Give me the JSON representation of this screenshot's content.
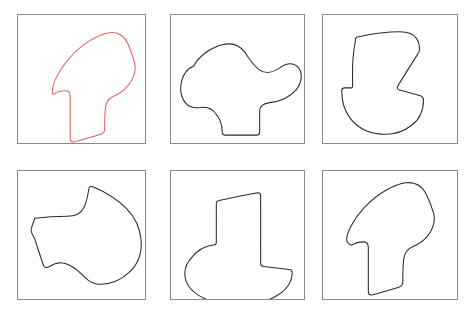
{
  "figure": {
    "kind": "mental-rotation-shape-grid",
    "background_color": "#ffffff",
    "rows": 2,
    "columns": 3,
    "panel_count": 6
  },
  "style": {
    "frame_color": "#8a8a8a",
    "frame_width": 1,
    "default_stroke_color": "#2b2b2b",
    "highlight_stroke_color": "#e06464",
    "stroke_width": 1.05
  },
  "panels": [
    {
      "id": "panel-1",
      "position": "row1-col1",
      "shape_name": "hooked-arch-blob",
      "stroke_color": "#e06464",
      "highlighted": true,
      "x": 17,
      "y": 14,
      "width": 129,
      "height": 130,
      "viewbox": "0 0 129 130",
      "path": "M 35 79 C 34 72 40 58 52 44 C 64 30 80 20 93 18 C 101 17 108 21 111 28 C 114 34 116 41 118 47 C 120 53 119 60 115 67 C 111 74 105 79 98 82 C 93 84 90 88 89 93 C 88 100 88 109 88 116 C 88 119 87 120 84 121 C 74 124 64 127 56 129 C 54 129 53 128 53 126 C 53 112 53 95 53 82 C 53 79 51 77 48 77 C 44 77 40 78 37 80 C 36 81 35 80 35 79 Z"
    },
    {
      "id": "panel-2",
      "position": "row1-col2",
      "shape_name": "smooth-blob-with-tab",
      "stroke_color": "#2b2b2b",
      "highlighted": false,
      "x": 170,
      "y": 14,
      "width": 135,
      "height": 130,
      "viewbox": "0 0 135 130",
      "path": "M 23 52 C 28 42 40 33 53 30 C 62 28 70 31 75 38 C 80 45 84 52 90 56 C 96 60 104 58 110 54 C 117 49 124 48 129 53 C 134 59 133 69 127 76 C 120 84 110 88 100 89 C 94 90 90 92 90 97 C 90 104 90 112 90 119 C 90 121 89 122 87 122 C 76 122 65 122 55 122 C 53 122 52 121 52 119 C 52 113 50 106 46 101 C 42 95 36 93 30 94 C 22 95 15 92 12 85 C 8 77 10 65 15 58 C 17 55 20 53 23 52 Z"
    },
    {
      "id": "panel-3",
      "position": "row1-col3",
      "shape_name": "notched-round-base-blob",
      "stroke_color": "#2b2b2b",
      "highlighted": false,
      "x": 322,
      "y": 14,
      "width": 136,
      "height": 130,
      "viewbox": "0 0 136 130",
      "path": "M 30 54 C 30 42 32 32 33 25 C 33 23 34 22 36 22 C 50 19 66 17 78 17 C 86 17 92 19 95 24 C 97 27 98 31 98 35 C 98 37 97 38 96 40 C 89 51 82 62 76 72 C 75 74 75 75 77 76 C 84 78 92 80 99 82 C 101 83 102 84 102 86 C 102 96 98 106 90 112 C 81 119 70 122 59 121 C 46 120 34 114 27 104 C 21 96 19 86 19 77 C 19 75 20 74 22 74 C 24 74 27 74 29 74 C 30 74 30 73 30 72 C 30 66 30 60 30 54 Z"
    },
    {
      "id": "panel-4",
      "position": "row2-col1",
      "shape_name": "hooked-arch-blob-rotated",
      "stroke_color": "#2b2b2b",
      "highlighted": false,
      "x": 17,
      "y": 170,
      "width": 129,
      "height": 130,
      "viewbox": "0 0 129 130",
      "path": "M 17 48 C 25 47 38 46 50 46 C 58 46 64 43 67 37 C 70 31 71 24 72 18 C 72 16 74 15 76 16 C 88 21 100 28 110 38 C 119 47 124 58 125 70 C 126 82 122 94 114 102 C 106 110 95 115 84 115 C 78 115 73 113 69 109 C 64 104 59 99 53 96 C 46 92 38 93 32 97 C 29 99 27 98 26 96 C 23 88 20 78 17 69 C 16 67 15 65 14 63 C 13 61 13 59 14 57 C 15 54 16 51 17 48 Z"
    },
    {
      "id": "panel-5",
      "position": "row2-col2",
      "shape_name": "notched-round-base-blob-rotated",
      "stroke_color": "#2b2b2b",
      "highlighted": false,
      "x": 170,
      "y": 170,
      "width": 135,
      "height": 130,
      "viewbox": "0 0 135 130",
      "path": "M 46 49 C 46 44 46 38 46 33 C 46 31 47 30 49 30 C 62 27 76 24 88 22 C 90 22 91 23 91 25 C 91 48 91 71 91 94 C 91 96 92 97 94 97 C 103 98 112 99 120 100 C 122 100 123 101 123 103 C 123 113 116 122 105 128 C 92 135 74 138 58 136 C 40 134 25 127 18 117 C 12 108 13 97 20 89 C 26 81 35 76 44 75 C 46 75 46 74 46 72 C 46 64 46 56 46 49 Z"
    },
    {
      "id": "panel-6",
      "position": "row2-col3",
      "shape_name": "hooked-arch-blob-copy",
      "stroke_color": "#2b2b2b",
      "highlighted": false,
      "x": 322,
      "y": 170,
      "width": 136,
      "height": 130,
      "viewbox": "0 0 136 130",
      "path": "M 24 70 C 24 63 30 50 42 37 C 55 23 71 14 84 12 C 93 11 100 15 104 22 C 107 28 110 35 112 42 C 114 48 113 55 109 62 C 105 69 98 74 91 77 C 86 79 83 83 82 89 C 81 96 81 106 81 113 C 81 116 80 117 77 118 C 67 121 57 124 49 126 C 47 126 46 125 46 123 C 46 109 46 91 46 78 C 46 74 44 72 41 72 C 37 72 33 73 30 75 C 28 76 24 73 24 70 Z"
    }
  ]
}
